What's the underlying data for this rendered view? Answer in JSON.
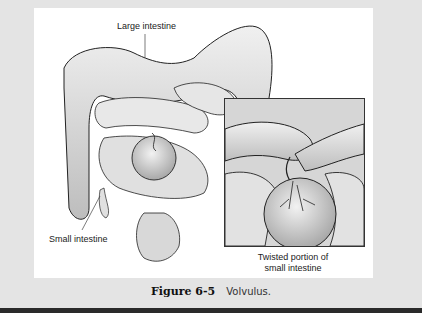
{
  "figure": {
    "labels": {
      "large_intestine": "Large intestine",
      "small_intestine": "Small intestine",
      "twisted_line1": "Twisted portion of",
      "twisted_line2": "small intestine"
    },
    "caption": {
      "number": "Figure 6-5",
      "title": "Volvulus."
    }
  },
  "colors": {
    "background": "#e4e4e4",
    "panel": "#ffffff",
    "organ_fill": "#d4d4d4",
    "outline": "#222222",
    "bottom_bar": "#2a2a2a"
  }
}
